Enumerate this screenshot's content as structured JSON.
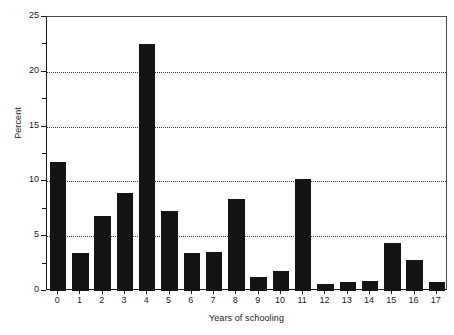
{
  "chart_data": {
    "type": "bar",
    "title": "",
    "subtitle": "",
    "xlabel": "Years of schooling",
    "ylabel": "Percent",
    "categories": [
      "0",
      "1",
      "2",
      "3",
      "4",
      "5",
      "6",
      "7",
      "8",
      "9",
      "10",
      "11",
      "12",
      "13",
      "14",
      "15",
      "16",
      "17"
    ],
    "values": [
      11.8,
      3.5,
      6.8,
      8.9,
      22.5,
      7.3,
      3.5,
      3.6,
      8.4,
      1.3,
      1.8,
      10.2,
      0.6,
      0.8,
      0.9,
      4.4,
      2.8,
      0.8
    ],
    "series": [
      {
        "name": "Percent",
        "values": [
          11.8,
          3.5,
          6.8,
          8.9,
          22.5,
          7.3,
          3.5,
          3.6,
          8.4,
          1.3,
          1.8,
          10.2,
          0.6,
          0.8,
          0.9,
          4.4,
          2.8,
          0.8
        ]
      }
    ],
    "ylim": [
      0,
      25
    ],
    "y_major_ticks": [
      0,
      5,
      10,
      15,
      20,
      25
    ],
    "y_minor_ticks": [
      2.5,
      7.5,
      12.5,
      17.5,
      22.5
    ],
    "y_tick_labels": [
      "0",
      "5",
      "10",
      "15",
      "20",
      "25"
    ],
    "grid": "horizontal-dotted",
    "gridlines_at": [
      5,
      10,
      15,
      20
    ],
    "legend": "none",
    "legend_position": "",
    "bar_color": "#141414",
    "axis_color": "#1a1a1a",
    "grid_color": "#3a3a3a",
    "background_color": "#ffffff",
    "annotations": []
  }
}
